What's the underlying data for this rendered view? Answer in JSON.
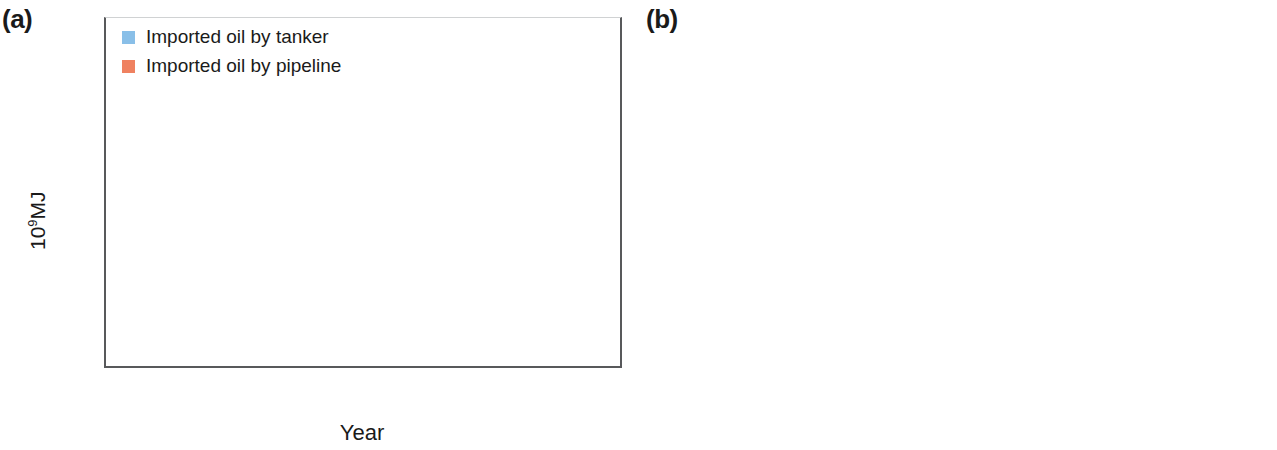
{
  "figure": {
    "panel_a_tag": "(a)",
    "panel_b_tag": "(b)"
  },
  "panel_a": {
    "tag": "(a)",
    "ylabel_main": "10",
    "ylabel_sup": "9",
    "ylabel_tail": "MJ",
    "xlabel": "Year",
    "yticks": [
      "0",
      "2000",
      "4000",
      "6000",
      "8000",
      "10000",
      "12000",
      "14000"
    ],
    "legend": [
      {
        "label": "Imported oil by tanker",
        "color": "#89bfe8"
      },
      {
        "label": "Imported oil by pipeline",
        "color": "#ef8160"
      }
    ]
  },
  "panel_b": {
    "tag": "(b)",
    "ylabel_main": "10",
    "ylabel_sup": "9",
    "ylabel_tail": "MJ",
    "xlabel": "Year",
    "yticks": [
      "0",
      "500",
      "1000",
      "1500",
      "2000",
      "2500"
    ],
    "legend": [
      {
        "label": "LNG imports",
        "color": "#89c6ef"
      },
      {
        "label": "Pipeline-gas imports",
        "color": "#9a5fa8"
      }
    ]
  },
  "chart_data": [
    {
      "type": "area",
      "stacked": true,
      "panel": "(a)",
      "title": "",
      "xlabel": "Year",
      "ylabel": "10^9 MJ",
      "ylim": [
        0,
        14000
      ],
      "ytick_step": 2000,
      "grid": false,
      "legend_position": "top-left",
      "categories": [
        "1996",
        "1997",
        "1998",
        "1999",
        "2000",
        "2001",
        "2002",
        "2003",
        "2004",
        "2005",
        "2006",
        "2007",
        "2008",
        "2009",
        "2010",
        "2011",
        "2012",
        "2013",
        "2014",
        "2015"
      ],
      "series": [
        {
          "name": "Imported oil by tanker",
          "color": "#89bfe8",
          "values": [
            650,
            1400,
            1180,
            1370,
            2580,
            2260,
            2480,
            3280,
            4280,
            4700,
            5280,
            6000,
            6980,
            7680,
            8600,
            9050,
            9500,
            9950,
            10400,
            6600
          ]
        },
        {
          "name": "Imported oil by pipeline",
          "color": "#ef8160",
          "values": [
            0,
            0,
            0,
            0,
            40,
            20,
            120,
            280,
            430,
            440,
            520,
            600,
            740,
            900,
            1000,
            1120,
            1250,
            1400,
            1550,
            760
          ]
        }
      ],
      "totals": [
        650,
        1400,
        1180,
        1370,
        2620,
        2280,
        2600,
        3560,
        4710,
        5140,
        5800,
        6600,
        7720,
        8580,
        9600,
        10170,
        10750,
        11350,
        11950,
        7360
      ]
    },
    {
      "type": "bar",
      "stacked": true,
      "panel": "(b)",
      "title": "",
      "xlabel": "Year",
      "ylabel": "10^9 MJ",
      "ylim": [
        0,
        2500
      ],
      "ytick_step": 500,
      "grid": true,
      "grid_style": "dashed-horizontal",
      "legend_position": "top-left",
      "categories": [
        "2009",
        "2010",
        "2011",
        "2012",
        "2013",
        "2014",
        "2015"
      ],
      "series": [
        {
          "name": "LNG imports",
          "color": "#89c6ef",
          "values": [
            370,
            575,
            740,
            875,
            1045,
            1150,
            620
          ]
        },
        {
          "name": "Pipeline-gas imports",
          "color": "#9a5fa8",
          "values": [
            0,
            145,
            560,
            880,
            1115,
            1160,
            680
          ]
        }
      ],
      "totals": [
        370,
        720,
        1300,
        1755,
        2160,
        2310,
        1300
      ]
    }
  ]
}
